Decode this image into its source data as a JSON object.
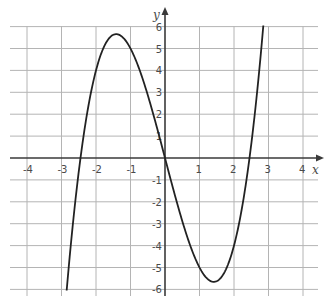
{
  "chart_data": {
    "type": "line",
    "title": "",
    "xlabel": "x",
    "ylabel": "y",
    "xlim": [
      -4.5,
      4.5
    ],
    "ylim": [
      -6.3,
      6.3
    ],
    "grid": true,
    "legend": null,
    "x_ticks": [
      -4,
      -3,
      -2,
      -1,
      1,
      2,
      3,
      4
    ],
    "y_ticks": [
      -6,
      -5,
      -4,
      -3,
      -2,
      -1,
      1,
      2,
      3,
      4,
      5,
      6
    ],
    "series": [
      {
        "name": "y = x^3 - 6x",
        "x": [
          -2.85,
          -2.75,
          -2.5,
          -2.45,
          -2.25,
          -2,
          -1.75,
          -1.5,
          -1.41,
          -1.25,
          -1,
          -0.75,
          -0.5,
          -0.25,
          0,
          0.25,
          0.5,
          0.75,
          1,
          1.25,
          1.41,
          1.5,
          1.75,
          2,
          2.25,
          2.45,
          2.5,
          2.75,
          2.85
        ],
        "values": [
          -6.05,
          -4.3,
          -0.63,
          0,
          2.11,
          4,
          5.14,
          5.63,
          5.66,
          5.55,
          5,
          4.08,
          2.88,
          1.48,
          0,
          -1.48,
          -2.88,
          -4.08,
          -5,
          -5.55,
          -5.66,
          -5.63,
          -5.14,
          -4,
          -2.11,
          0,
          0.63,
          4.3,
          6.05
        ]
      }
    ],
    "key_points": {
      "local_max": [
        -1.41,
        5.66
      ],
      "local_min": [
        1.41,
        -5.66
      ],
      "roots": [
        -2.45,
        0,
        2.45
      ]
    }
  },
  "labels": {
    "x_axis": "x",
    "y_axis": "y",
    "x_tick_labels": [
      "-4",
      "-3",
      "-2",
      "-1",
      "1",
      "2",
      "3",
      "4"
    ],
    "y_tick_labels": [
      "6",
      "5",
      "4",
      "3",
      "2",
      "1",
      "-1",
      "-2",
      "-3",
      "-4",
      "-5",
      "-6"
    ]
  }
}
